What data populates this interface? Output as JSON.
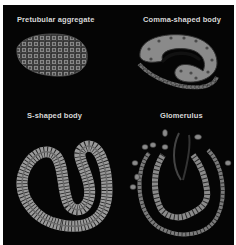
{
  "figure": {
    "panels": [
      {
        "id": "pretubular",
        "label": "Pretubular aggregate"
      },
      {
        "id": "comma",
        "label": "Comma-shaped body"
      },
      {
        "id": "s-shaped",
        "label": "S-shaped body"
      },
      {
        "id": "glomerulus",
        "label": "Glomerulus"
      }
    ],
    "colors": {
      "background": "#050505",
      "cell_fill": "#8a8a8a",
      "cell_stroke": "#2a2a2a",
      "nucleus": "#3a3a3a",
      "label": "#d8d8d8"
    }
  }
}
